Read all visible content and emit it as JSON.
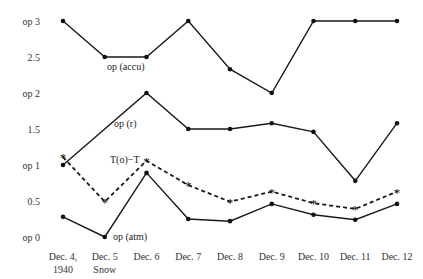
{
  "chart_data": {
    "type": "line",
    "title": "",
    "xlabel": "",
    "ylabel": "",
    "categories": [
      "Dec. 4, 1940",
      "Dec. 5 Snow",
      "Dec. 6",
      "Dec. 7",
      "Dec. 8",
      "Dec. 9",
      "Dec. 10",
      "Dec. 11",
      "Dec. 12"
    ],
    "x_tick_lines": [
      [
        "Dec. 4,",
        "1940"
      ],
      [
        "Dec. 5",
        "Snow"
      ],
      [
        "Dec. 6"
      ],
      [
        "Dec. 7"
      ],
      [
        "Dec. 8"
      ],
      [
        "Dec. 9"
      ],
      [
        "Dec. 10"
      ],
      [
        "Dec. 11"
      ],
      [
        "Dec. 12"
      ]
    ],
    "y_ticks": [
      {
        "value": 3,
        "label": "op 3"
      },
      {
        "value": 2.5,
        "label": "2.5"
      },
      {
        "value": 2,
        "label": "op 2"
      },
      {
        "value": 1.5,
        "label": "1.5"
      },
      {
        "value": 1,
        "label": "op 1"
      },
      {
        "value": 0.5,
        "label": "0.5"
      },
      {
        "value": 0,
        "label": "op 0"
      }
    ],
    "ylim": [
      0,
      3
    ],
    "grid": false,
    "legend": "inline labels",
    "series": [
      {
        "name": "op (accu)",
        "style": "solid",
        "marker": "dot",
        "values": [
          3.0,
          2.5,
          2.5,
          3.0,
          2.33,
          2.0,
          3.0,
          3.0,
          3.0
        ],
        "label_anchor_index": 1
      },
      {
        "name": "op (r)",
        "style": "solid",
        "marker": "dot",
        "values": [
          1.0,
          null,
          2.0,
          1.5,
          1.5,
          1.58,
          1.46,
          0.78,
          1.58
        ],
        "label_anchor_index": 1
      },
      {
        "name": "T(o)−T",
        "style": "dashed",
        "marker": "asterisk",
        "values": [
          1.11,
          0.49,
          1.06,
          0.72,
          0.49,
          0.63,
          0.47,
          0.39,
          0.63
        ],
        "label_anchor_index": 2
      },
      {
        "name": "op (atm)",
        "style": "solid",
        "marker": "dot",
        "values": [
          0.28,
          0.0,
          0.89,
          0.25,
          0.22,
          0.46,
          0.31,
          0.24,
          0.46
        ],
        "label_anchor_index": 1
      }
    ]
  },
  "labels": {
    "accu": "op (accu)",
    "r": "op (r)",
    "tdiff": "T(o)−T",
    "atm": "op (atm)"
  }
}
